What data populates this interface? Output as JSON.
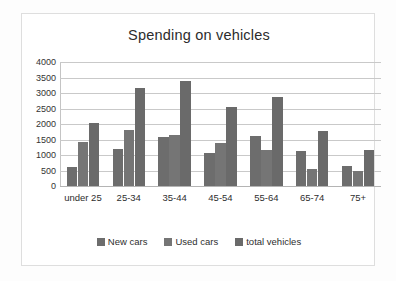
{
  "chart_data": {
    "type": "bar",
    "title": "Spending on vehicles",
    "xlabel": "",
    "ylabel": "",
    "categories": [
      "under 25",
      "25-34",
      "35-44",
      "45-54",
      "55-64",
      "65-74",
      "75+"
    ],
    "series": [
      {
        "name": "New cars",
        "color": "#6d6d6d",
        "values": [
          600,
          1200,
          1580,
          1080,
          1600,
          1120,
          650
        ]
      },
      {
        "name": "Used cars",
        "color": "#757575",
        "values": [
          1420,
          1800,
          1650,
          1400,
          1150,
          540,
          470
        ]
      },
      {
        "name": "total vehicles",
        "color": "#6a6a6a",
        "values": [
          2040,
          3150,
          3400,
          2560,
          2880,
          1770,
          1170
        ]
      }
    ],
    "ylim": [
      0,
      4000
    ],
    "yticks": [
      0,
      500,
      1000,
      1500,
      2000,
      2500,
      3000,
      3500,
      4000
    ],
    "ytick_labels": [
      "0",
      "500",
      "1000",
      "1500",
      "2000",
      "2500",
      "3000",
      "3500",
      "4000"
    ],
    "grid": true,
    "legend_position": "bottom",
    "legend_entries": [
      "New cars",
      "Used cars",
      "total vehicles"
    ]
  }
}
